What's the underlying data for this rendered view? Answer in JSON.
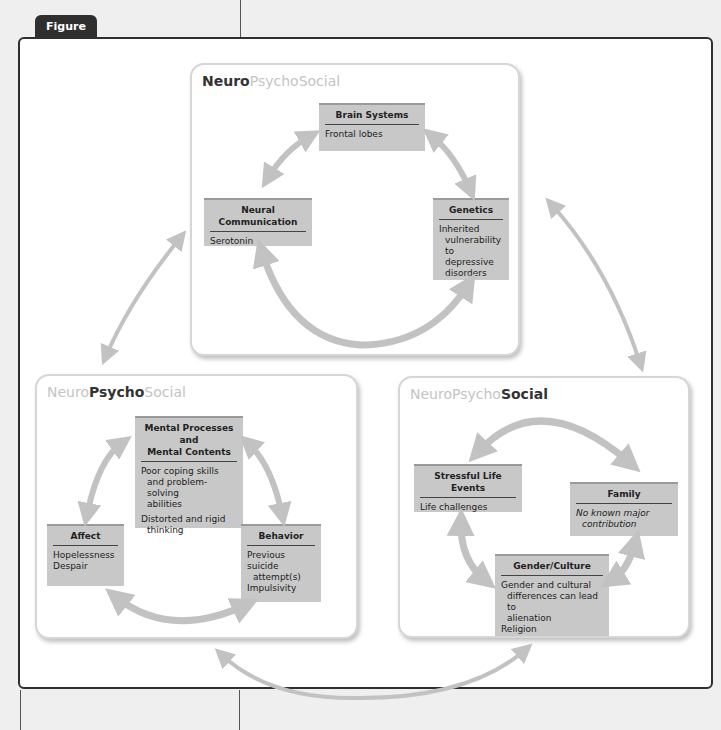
{
  "figure": {
    "label": "Figure 6.8"
  },
  "panels": {
    "neuro": {
      "title_parts": [
        "Neuro",
        "Psycho",
        "Social"
      ],
      "emphasis": "Neuro",
      "nodes": {
        "brain_systems": {
          "title": "Brain Systems",
          "lines": [
            "Frontal lobes"
          ]
        },
        "neural_communication": {
          "title": "Neural Communication",
          "lines": [
            "Serotonin"
          ]
        },
        "genetics": {
          "title": "Genetics",
          "lines": [
            "Inherited",
            "vulnerability",
            "to depressive",
            "disorders"
          ]
        }
      }
    },
    "psycho": {
      "title_parts": [
        "Neuro",
        "Psycho",
        "Social"
      ],
      "emphasis": "Psycho",
      "nodes": {
        "mental_processes": {
          "title_lines": [
            "Mental Processes and",
            "Mental Contents"
          ],
          "lines": [
            "Poor coping skills",
            "and problem-solving",
            "abilities",
            "Distorted and rigid",
            "thinking"
          ]
        },
        "affect": {
          "title": "Affect",
          "lines": [
            "Hopelessness",
            "Despair"
          ]
        },
        "behavior": {
          "title": "Behavior",
          "lines": [
            "Previous suicide",
            "attempt(s)",
            "Impulsivity"
          ]
        }
      }
    },
    "social": {
      "title_parts": [
        "Neuro",
        "Psycho",
        "Social"
      ],
      "emphasis": "Social",
      "nodes": {
        "stressful_life_events": {
          "title": "Stressful Life Events",
          "lines": [
            "Life challenges"
          ]
        },
        "family": {
          "title": "Family",
          "lines": [
            "No known major",
            "contribution"
          ]
        },
        "gender_culture": {
          "title": "Gender/Culture",
          "lines": [
            "Gender and cultural",
            "differences can lead to",
            "alienation",
            "Religion"
          ]
        }
      }
    }
  },
  "colors": {
    "arrow": "#c2c2c2",
    "node_fill": "#c8c8c8",
    "tab_fill": "#2f2f2f",
    "title_dim": "#c4c4c4",
    "title_strong": "#333333"
  }
}
